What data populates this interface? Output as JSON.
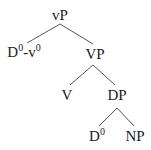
{
  "diagram": {
    "type": "syntax-tree",
    "nodes": {
      "vP": {
        "label": "vP"
      },
      "Dv": {
        "label_base1": "D",
        "sup1": "0",
        "sep": "-v",
        "sup2": "0"
      },
      "VP": {
        "label": "VP"
      },
      "V": {
        "label": "V"
      },
      "DP": {
        "label": "DP"
      },
      "D0": {
        "label_base": "D",
        "sup": "0"
      },
      "NP": {
        "label": "NP"
      }
    },
    "edges": [
      [
        "vP",
        "D0-v0"
      ],
      [
        "vP",
        "VP"
      ],
      [
        "VP",
        "V"
      ],
      [
        "VP",
        "DP"
      ],
      [
        "DP",
        "D0"
      ],
      [
        "DP",
        "NP"
      ]
    ],
    "line_color": "#555555",
    "text_color": "#1a1a1a"
  }
}
